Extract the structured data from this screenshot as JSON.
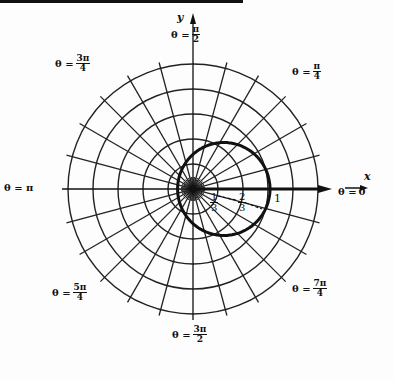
{
  "diagram": {
    "origin": {
      "x": 193,
      "y": 189
    },
    "unit_px": 77,
    "grid": {
      "circle_radii_px": [
        25,
        50,
        75,
        100,
        125
      ],
      "radial_line_count": 24,
      "radial_inner_px": 12,
      "radial_outer_px": 131
    },
    "curve": {
      "equation": "r = 1/(3 - 2cosθ)",
      "stroke": "#111111",
      "stroke_width": 3
    },
    "colors": {
      "grid": "#222222",
      "axis": "#111111",
      "background": "#fdfdfd"
    },
    "axes": {
      "x_label": "x",
      "y_label": "y"
    },
    "angle_labels": [
      {
        "id": "theta-0",
        "prefix": "θ = ",
        "text": "0",
        "x": 338,
        "y": 194
      },
      {
        "id": "theta-pi-4",
        "prefix": "θ = ",
        "num": "π",
        "den": "4",
        "x": 292,
        "y": 70
      },
      {
        "id": "theta-pi-2",
        "prefix": "θ = ",
        "num": "π",
        "den": "2",
        "x": 171,
        "y": 33
      },
      {
        "id": "theta-3pi-4",
        "prefix": "θ = ",
        "num": "3π",
        "den": "4",
        "x": 55,
        "y": 62
      },
      {
        "id": "theta-pi",
        "prefix": "θ = π",
        "text": "",
        "x": 4,
        "y": 190
      },
      {
        "id": "theta-5pi-4",
        "prefix": "θ = ",
        "num": "5π",
        "den": "4",
        "x": 52,
        "y": 291
      },
      {
        "id": "theta-3pi-2",
        "prefix": "θ = ",
        "num": "3π",
        "den": "2",
        "x": 172,
        "y": 333
      },
      {
        "id": "theta-7pi-4",
        "prefix": "θ = ",
        "num": "7π",
        "den": "4",
        "x": 292,
        "y": 287
      }
    ],
    "tick_labels": [
      {
        "id": "tick-one-third",
        "num": "1",
        "den": "3",
        "x": 210,
        "y": 192
      },
      {
        "id": "tick-two-thirds",
        "num": "2",
        "den": "3",
        "x": 238,
        "y": 192
      },
      {
        "id": "tick-one",
        "text": "1",
        "x": 274,
        "y": 192
      }
    ]
  }
}
